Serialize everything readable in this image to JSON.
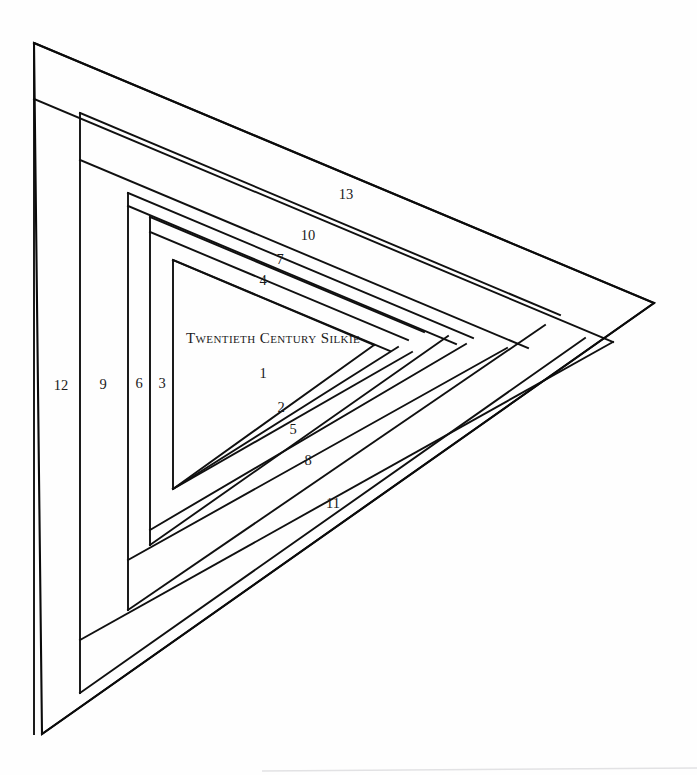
{
  "canvas": {
    "width": 697,
    "height": 775,
    "background_color": "#fefefe",
    "line_color": "#101010",
    "text_color": "#1a1a1a",
    "faint_rule_color": "#e2e2e4"
  },
  "block": {
    "title": "Twentieth Century Silkie",
    "title_position": {
      "x": 186,
      "y": 343
    },
    "type": "log-cabin-triangle",
    "strip_count": 13,
    "outline": {
      "name": "outer-triangle",
      "points": "34,43 654,303 42,734"
    }
  },
  "strips": [
    {
      "n": "1",
      "label_x": 263,
      "label_y": 378,
      "orientation": "diagonal-lower"
    },
    {
      "n": "2",
      "label_x": 281,
      "label_y": 412,
      "orientation": "diagonal-lower"
    },
    {
      "n": "3",
      "label_x": 162,
      "label_y": 388,
      "orientation": "vertical-left"
    },
    {
      "n": "4",
      "label_x": 263,
      "label_y": 285,
      "orientation": "diagonal-upper"
    },
    {
      "n": "5",
      "label_x": 293,
      "label_y": 434,
      "orientation": "diagonal-lower"
    },
    {
      "n": "6",
      "label_x": 139,
      "label_y": 388,
      "orientation": "vertical-left"
    },
    {
      "n": "7",
      "label_x": 280,
      "label_y": 264,
      "orientation": "diagonal-upper"
    },
    {
      "n": "8",
      "label_x": 308,
      "label_y": 465,
      "orientation": "diagonal-lower"
    },
    {
      "n": "9",
      "label_x": 103,
      "label_y": 389,
      "orientation": "vertical-left"
    },
    {
      "n": "10",
      "label_x": 308,
      "label_y": 240,
      "orientation": "diagonal-upper"
    },
    {
      "n": "11",
      "label_x": 333,
      "label_y": 508,
      "orientation": "diagonal-lower"
    },
    {
      "n": "12",
      "label_x": 61,
      "label_y": 390,
      "orientation": "vertical-left"
    },
    {
      "n": "13",
      "label_x": 346,
      "label_y": 199,
      "orientation": "diagonal-upper"
    }
  ],
  "geometry": {
    "upper_diagonals": [
      {
        "name": "upper-edge-0",
        "points": "34,43 654,303"
      },
      {
        "name": "upper-edge-1",
        "points": "34,99 613,342"
      },
      {
        "name": "upper-edge-2",
        "points": "80,113 560,315"
      },
      {
        "name": "upper-edge-3",
        "points": "80,160 528,348"
      },
      {
        "name": "upper-edge-4",
        "points": "128,193 473,338"
      },
      {
        "name": "upper-edge-5",
        "points": "128,206 456,344"
      },
      {
        "name": "upper-edge-6",
        "points": "150,217 424,332"
      },
      {
        "name": "upper-edge-7",
        "points": "150,232 408,340"
      },
      {
        "name": "upper-edge-8",
        "points": "173,260 390,351"
      },
      {
        "name": "upper-edge-9",
        "points": "173,260 374,345"
      }
    ],
    "lower_diagonals": [
      {
        "name": "lower-edge-0",
        "points": "42,734 654,303"
      },
      {
        "name": "lower-edge-1",
        "points": "80,640 613,342"
      },
      {
        "name": "lower-edge-2",
        "points": "80,693 585,338"
      },
      {
        "name": "lower-edge-3",
        "points": "128,610 545,325"
      },
      {
        "name": "lower-edge-4",
        "points": "128,560 507,348"
      },
      {
        "name": "lower-edge-5",
        "points": "150,530 466,344"
      },
      {
        "name": "lower-edge-6",
        "points": "150,545 448,336"
      },
      {
        "name": "lower-edge-7",
        "points": "173,489 412,352"
      },
      {
        "name": "lower-edge-8",
        "points": "173,489 398,347"
      },
      {
        "name": "lower-edge-9",
        "points": "173,489 374,345"
      }
    ],
    "verticals": [
      {
        "name": "vertical-0",
        "x": 34,
        "y1": 43,
        "y2": 734
      },
      {
        "name": "vertical-1",
        "x": 80,
        "y1": 113,
        "y2": 693
      },
      {
        "name": "vertical-2",
        "x": 128,
        "y1": 193,
        "y2": 610
      },
      {
        "name": "vertical-3",
        "x": 150,
        "y1": 217,
        "y2": 545
      },
      {
        "name": "vertical-4",
        "x": 173,
        "y1": 260,
        "y2": 489
      }
    ],
    "faint_rule": {
      "name": "bottom-faint-rule",
      "x1": 262,
      "y1": 771,
      "x2": 697,
      "y2": 768
    }
  }
}
